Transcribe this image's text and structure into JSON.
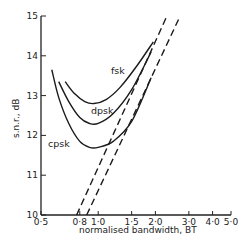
{
  "chart_data": {
    "type": "line",
    "title": "",
    "xlabel": "normalised bandwidth, BT",
    "ylabel": "s.n.r., dB",
    "xscale": "log",
    "xlim": [
      0.5,
      5.0
    ],
    "ylim": [
      10,
      15
    ],
    "x_ticks": [
      "0·5",
      "0·8",
      "1·0",
      "1·5",
      "2·0",
      "3·0",
      "4·0",
      "5·0"
    ],
    "x_tick_values": [
      0.5,
      0.8,
      1.0,
      1.5,
      2.0,
      3.0,
      4.0,
      5.0
    ],
    "y_ticks": [
      "10",
      "11",
      "12",
      "13",
      "14",
      "15"
    ],
    "y_tick_values": [
      10,
      11,
      12,
      13,
      14,
      15
    ],
    "grid": false,
    "legend": "inline labels",
    "series": [
      {
        "name": "fsk",
        "style": "solid",
        "x": [
          0.67,
          0.75,
          0.85,
          0.95,
          1.1,
          1.3,
          1.6,
          1.95
        ],
        "y": [
          13.35,
          13.05,
          12.85,
          12.8,
          12.9,
          13.2,
          13.75,
          14.35
        ]
      },
      {
        "name": "dpsk",
        "style": "solid",
        "x": [
          0.62,
          0.7,
          0.8,
          0.9,
          1.0,
          1.2,
          1.5,
          1.9
        ],
        "y": [
          13.35,
          12.85,
          12.45,
          12.3,
          12.3,
          12.55,
          13.15,
          14.1
        ]
      },
      {
        "name": "cpsk",
        "style": "solid",
        "x": [
          0.57,
          0.62,
          0.7,
          0.8,
          0.9,
          1.0,
          1.2,
          1.5,
          1.9
        ],
        "y": [
          13.65,
          12.95,
          12.3,
          11.85,
          11.7,
          11.7,
          11.85,
          12.35,
          13.45
        ]
      },
      {
        "name": "dashed limit 1",
        "style": "dashed",
        "x": [
          0.77,
          2.3
        ],
        "y": [
          10.0,
          15.0
        ]
      },
      {
        "name": "dashed limit 2",
        "style": "dashed",
        "x": [
          0.87,
          2.7
        ],
        "y": [
          10.0,
          15.0
        ]
      }
    ]
  }
}
